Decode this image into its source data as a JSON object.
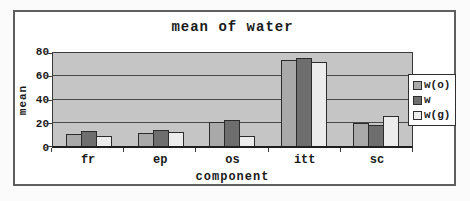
{
  "chart_data": {
    "type": "bar",
    "title": "mean of water",
    "xlabel": "component",
    "ylabel": "mean",
    "categories": [
      "fr",
      "ep",
      "os",
      "itt",
      "sc"
    ],
    "series": [
      {
        "name": "w(o)",
        "color": "#a9a9a9",
        "values": [
          10,
          11,
          21,
          74,
          20
        ]
      },
      {
        "name": "w",
        "color": "#6e6e6e",
        "values": [
          13,
          14,
          22,
          76,
          18
        ]
      },
      {
        "name": "w(g)",
        "color": "#ececec",
        "values": [
          9,
          12,
          9,
          72,
          26
        ]
      }
    ],
    "ylim": [
      0,
      80
    ],
    "yticks": [
      0,
      20,
      40,
      60,
      80
    ],
    "grid": true,
    "legend_position": "right",
    "colors": {
      "plot_bg": "#c5c5c5",
      "figure_bg": "#ffffff",
      "axis": "#333333"
    }
  }
}
